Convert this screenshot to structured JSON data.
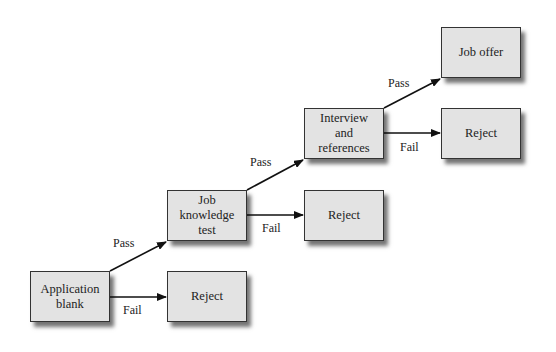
{
  "diagram": {
    "type": "flowchart",
    "colors": {
      "box_fill": "#e3e3e3",
      "box_border": "#333333",
      "arrow": "#111111",
      "background": "#ffffff"
    },
    "nodes": [
      {
        "id": "application",
        "label": "Application\nblank",
        "x": 30,
        "y": 271
      },
      {
        "id": "reject1",
        "label": "Reject",
        "x": 167,
        "y": 271
      },
      {
        "id": "jobtest",
        "label": "Job\nknowledge\ntest",
        "x": 167,
        "y": 190
      },
      {
        "id": "reject2",
        "label": "Reject",
        "x": 304,
        "y": 190
      },
      {
        "id": "interview",
        "label": "Interview\nand\nreferences",
        "x": 304,
        "y": 108
      },
      {
        "id": "reject3",
        "label": "Reject",
        "x": 441,
        "y": 108
      },
      {
        "id": "joboffer",
        "label": "Job offer",
        "x": 441,
        "y": 27
      }
    ],
    "edges": [
      {
        "from": "application",
        "to": "jobtest",
        "label": "Pass"
      },
      {
        "from": "application",
        "to": "reject1",
        "label": "Fail"
      },
      {
        "from": "jobtest",
        "to": "interview",
        "label": "Pass"
      },
      {
        "from": "jobtest",
        "to": "reject2",
        "label": "Fail"
      },
      {
        "from": "interview",
        "to": "joboffer",
        "label": "Pass"
      },
      {
        "from": "interview",
        "to": "reject3",
        "label": "Fail"
      }
    ]
  }
}
